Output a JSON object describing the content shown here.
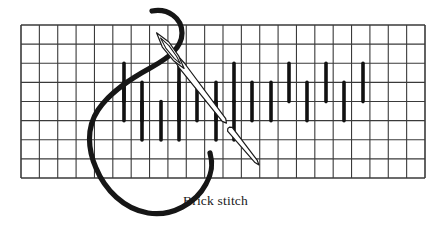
{
  "figure": {
    "kind": "embroidery-technique-diagram",
    "caption": "Brick stitch",
    "caption_position": {
      "x": 183,
      "y": 205
    },
    "background_color": "#ffffff",
    "ink_color": "#1a1a1a"
  },
  "canvas": {
    "width": 447,
    "height": 230
  },
  "grid": {
    "label": "canvas-fabric-grid",
    "x": 21,
    "y": 25,
    "width": 404,
    "height": 153,
    "columns": 22,
    "rows": 8,
    "cell_width": 18.36,
    "cell_height": 19.13,
    "line_color": "#3a3a3a",
    "line_width": 1.1,
    "border_width": 1.6
  },
  "stitches": {
    "label": "brick-stitch-bars",
    "color": "#111111",
    "bar_width": 3.6,
    "bar_length": 38.3,
    "description": "Vertical bars each spanning two grid rows, staggered in a brick layout across three offset tiers.",
    "rows": [
      {
        "tier": "upper",
        "y_top": 63.3,
        "y_bottom": 101.6,
        "x_positions": [
          124,
          179,
          234,
          289,
          326,
          363
        ]
      },
      {
        "tier": "middle",
        "y_top": 82.4,
        "y_bottom": 120.7,
        "x_positions": [
          124,
          142,
          179,
          197,
          216,
          252,
          271,
          307,
          344
        ]
      },
      {
        "tier": "lower",
        "y_top": 101.6,
        "y_bottom": 139.9,
        "x_positions": [
          142,
          161,
          179,
          216,
          234
        ]
      }
    ]
  },
  "needle": {
    "label": "sewing-needle",
    "outline_color": "#1a1a1a",
    "fill_color": "#ffffff",
    "stroke_width": 1.2,
    "upper_segment": {
      "tip_x": 159,
      "tip_y": 36,
      "end_x": 224,
      "end_y": 120,
      "eye_length": 36,
      "body_width": 7
    },
    "lower_segment": {
      "start_x": 228,
      "start_y": 127,
      "end_x": 259,
      "end_y": 165,
      "body_width": 6
    }
  },
  "thread": {
    "label": "working-thread",
    "color": "#161616",
    "stroke_width": 5.2,
    "description": "Thread enters from the top of the frame, passes through the needle eye, loops down and around to the left, and rises back up to the right where it exits the fabric.",
    "path_summary": {
      "entry_point": [
        152,
        11
      ],
      "exit_point": [
        210,
        153
      ],
      "lowest_point_y": 213,
      "leftmost_point_x": 92
    }
  },
  "legend_note": "Diagram of the brick stitch worked on even-weave canvas."
}
